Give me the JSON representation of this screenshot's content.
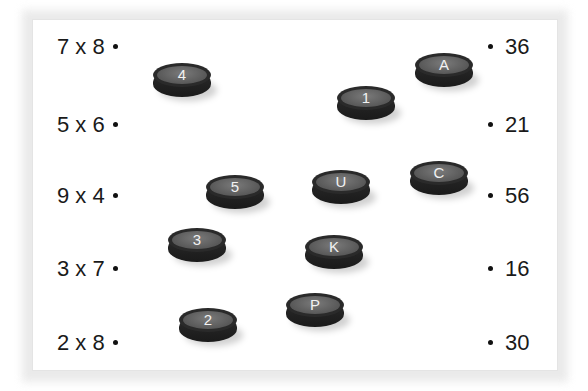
{
  "worksheet": {
    "left_expressions": [
      {
        "text": "7 x 8",
        "top": 36
      },
      {
        "text": "5 x 6",
        "top": 114
      },
      {
        "text": "9 x 4",
        "top": 185
      },
      {
        "text": "3 x 7",
        "top": 258
      },
      {
        "text": "2 x 8",
        "top": 332
      }
    ],
    "right_answers": [
      {
        "text": "36",
        "top": 36
      },
      {
        "text": "21",
        "top": 114
      },
      {
        "text": "56",
        "top": 185
      },
      {
        "text": "16",
        "top": 258
      },
      {
        "text": "30",
        "top": 332
      }
    ],
    "pucks": [
      {
        "label": "4",
        "x": 153,
        "y": 63
      },
      {
        "label": "A",
        "x": 415,
        "y": 53
      },
      {
        "label": "1",
        "x": 337,
        "y": 86
      },
      {
        "label": "5",
        "x": 206,
        "y": 175
      },
      {
        "label": "U",
        "x": 312,
        "y": 170
      },
      {
        "label": "C",
        "x": 410,
        "y": 161
      },
      {
        "label": "3",
        "x": 168,
        "y": 228
      },
      {
        "label": "K",
        "x": 305,
        "y": 235
      },
      {
        "label": "P",
        "x": 286,
        "y": 293
      },
      {
        "label": "2",
        "x": 179,
        "y": 308
      }
    ],
    "colors": {
      "puck_body": "#1e1e1e",
      "puck_face": "#666666",
      "puck_text": "#f2f2f2",
      "text": "#1a1a1a",
      "frame_shadow": "#e4e4e4"
    }
  }
}
